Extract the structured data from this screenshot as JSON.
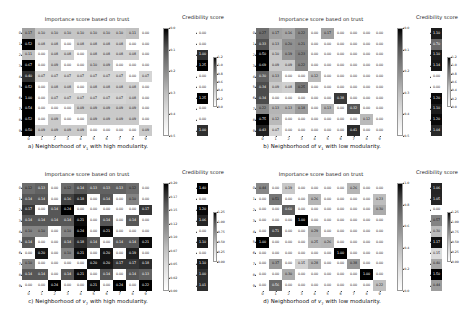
{
  "figure": {
    "width": 468,
    "height": 311,
    "background": "#ffffff",
    "colormap": "Greys"
  },
  "labels": {
    "importance_title": "Importance score based on trust",
    "credibility_title": "Credibility score",
    "xticks": [
      "0",
      "1",
      "2",
      "3",
      "4",
      "5",
      "6",
      "7",
      "8",
      "9"
    ],
    "yticks": [
      "0",
      "1",
      "2",
      "3",
      "4",
      "5",
      "6",
      "7",
      "8",
      "9"
    ],
    "cred_xtick": "0"
  },
  "panels": [
    {
      "id": "a",
      "caption_prefix": "a) Neighborhood of ",
      "caption_var": "v",
      "caption_sub": "1",
      "caption_suffix": " with high modularity.",
      "chart_data": {
        "type": "heatmap",
        "title": "Importance score based on trust",
        "xlabel": "",
        "ylabel": "",
        "xticklabels": [
          "0",
          "1",
          "2",
          "3",
          "4",
          "5",
          "6",
          "7",
          "8",
          "9"
        ],
        "yticklabels": [
          "0",
          "1",
          "2",
          "3",
          "4",
          "5",
          "6",
          "7",
          "8",
          "9"
        ],
        "cmap": "Greys",
        "vmin": 0.0,
        "vmax": 0.5,
        "colorbar_ticks": [
          "0.0",
          "0.1",
          "0.2",
          "0.3",
          "0.4",
          "0.5"
        ],
        "values": [
          [
            0.17,
            0.1,
            0.1,
            0.1,
            0.1,
            0.1,
            0.1,
            0.1,
            0.11,
            0.0
          ],
          [
            0.52,
            0.08,
            0.08,
            0.0,
            0.08,
            0.08,
            0.08,
            0.08,
            0.0,
            0.0
          ],
          [
            0.11,
            0.0,
            0.08,
            0.08,
            0.0,
            0.08,
            0.08,
            0.08,
            0.08,
            0.0
          ],
          [
            0.67,
            0.0,
            0.09,
            0.0,
            0.0,
            0.1,
            0.09,
            0.0,
            0.0,
            0.0
          ],
          [
            0.4,
            0.07,
            0.07,
            0.07,
            0.07,
            0.07,
            0.07,
            0.07,
            0.0,
            0.07
          ],
          [
            0.52,
            0.0,
            0.08,
            0.08,
            0.0,
            0.08,
            0.08,
            0.08,
            0.08,
            0.0
          ],
          [
            1.0,
            0.0,
            0.07,
            0.07,
            0.07,
            0.07,
            0.07,
            0.07,
            0.08,
            0.0
          ],
          [
            0.54,
            0.0,
            0.0,
            0.0,
            0.09,
            0.09,
            0.09,
            0.09,
            0.09,
            0.0
          ],
          [
            0.52,
            0.0,
            0.09,
            0.0,
            0.0,
            0.09,
            0.09,
            0.09,
            0.09,
            0.0
          ],
          [
            0.5,
            0.09,
            0.09,
            0.09,
            0.09,
            0.0,
            0.0,
            0.0,
            0.0,
            0.09
          ]
        ]
      },
      "credibility": {
        "type": "heatmap",
        "title": "Credibility score",
        "cmap": "Greys",
        "vmin": 0.0,
        "vmax": 1.25,
        "colorbar_ticks": [
          "1.2",
          "1.0",
          "0.8",
          "0.6",
          "0.4",
          "0.2",
          "0.0"
        ],
        "values": [
          [
            0.0
          ],
          [
            0.0
          ],
          [
            1.0
          ],
          [
            1.25
          ],
          [
            0.0
          ],
          [
            0.0
          ],
          [
            1.25
          ],
          [
            0.0
          ],
          [
            0.0
          ],
          [
            1.0
          ]
        ]
      }
    },
    {
      "id": "b",
      "caption_prefix": "b) Neighborhood of ",
      "caption_var": "v",
      "caption_sub": "1",
      "caption_suffix": " with low modularity.",
      "chart_data": {
        "type": "heatmap",
        "title": "Importance score based on trust",
        "xlabel": "",
        "ylabel": "",
        "xticklabels": [
          "0",
          "1",
          "2",
          "3",
          "4",
          "5",
          "6",
          "7",
          "8",
          "9"
        ],
        "yticklabels": [
          "0",
          "1",
          "2",
          "3",
          "4",
          "5",
          "6",
          "7",
          "8",
          "9"
        ],
        "cmap": "Greys",
        "vmin": 0.0,
        "vmax": 0.5,
        "colorbar_ticks": [
          "0.0",
          "0.1",
          "0.2",
          "0.3",
          "0.4",
          "0.5"
        ],
        "values": [
          [
            0.27,
            0.17,
            0.16,
            0.22,
            0.0,
            0.17,
            0.0,
            0.0,
            0.0,
            0.0
          ],
          [
            0.33,
            0.13,
            0.2,
            0.21,
            0.0,
            0.0,
            0.0,
            0.0,
            0.0,
            0.0
          ],
          [
            0.5,
            0.1,
            0.19,
            0.23,
            0.0,
            0.0,
            0.0,
            0.0,
            0.0,
            0.0
          ],
          [
            0.69,
            0.09,
            0.09,
            0.22,
            0.0,
            0.0,
            0.0,
            0.0,
            0.0,
            0.0
          ],
          [
            0.3,
            0.13,
            0.0,
            0.0,
            0.12,
            0.0,
            0.0,
            0.0,
            0.0,
            0.0
          ],
          [
            0.34,
            0.09,
            0.08,
            0.25,
            0.0,
            0.0,
            0.0,
            0.0,
            0.0,
            0.0
          ],
          [
            0.34,
            0.0,
            0.0,
            0.0,
            0.0,
            0.0,
            0.38,
            0.0,
            0.0,
            0.0
          ],
          [
            0.22,
            0.13,
            0.13,
            0.18,
            0.0,
            0.13,
            0.0,
            0.32,
            0.0,
            0.0
          ],
          [
            0.75,
            0.12,
            0.0,
            0.0,
            0.0,
            0.0,
            0.0,
            0.0,
            0.12,
            0.0
          ],
          [
            0.43,
            0.07,
            0.0,
            0.0,
            0.0,
            0.0,
            0.0,
            0.41,
            0.0,
            0.0
          ]
        ]
      },
      "credibility": {
        "type": "heatmap",
        "title": "Credibility score",
        "cmap": "Greys",
        "vmin": 0.0,
        "vmax": 1.25,
        "colorbar_ticks": [
          "1.2",
          "1.0",
          "0.8",
          "0.6",
          "0.4",
          "0.2",
          "0.0"
        ],
        "values": [
          [
            1.1
          ],
          [
            0.7
          ],
          [
            1.1
          ],
          [
            1.14
          ],
          [
            0.0
          ],
          [
            0.0
          ],
          [
            1.2
          ],
          [
            1.1
          ],
          [
            1.2
          ],
          [
            1.04
          ]
        ]
      }
    },
    {
      "id": "c",
      "caption_prefix": "c) Neighborhood of ",
      "caption_var": "v",
      "caption_sub": "7",
      "caption_suffix": " with high modularity.",
      "chart_data": {
        "type": "heatmap",
        "title": "Importance score based on trust",
        "xlabel": "",
        "ylabel": "",
        "xticklabels": [
          "0",
          "1",
          "2",
          "3",
          "4",
          "5",
          "6",
          "7",
          "8",
          "9"
        ],
        "yticklabels": [
          "0",
          "1",
          "2",
          "3",
          "4",
          "5",
          "6",
          "7",
          "8",
          "9"
        ],
        "cmap": "Greys",
        "vmin": 0.0,
        "vmax": 0.22,
        "colorbar_ticks": [
          "0.20",
          "0.17",
          "0.15",
          "0.12",
          "0.10",
          "0.07",
          "0.05",
          "0.02",
          "0.00"
        ],
        "values": [
          [
            0.12,
            0.13,
            0.0,
            0.12,
            0.14,
            0.13,
            0.13,
            0.13,
            0.12,
            0.0
          ],
          [
            0.14,
            0.14,
            0.0,
            0.16,
            0.18,
            0.0,
            0.14,
            0.0,
            0.1,
            0.0
          ],
          [
            0.17,
            0.0,
            0.14,
            0.24,
            0.0,
            0.0,
            0.0,
            0.0,
            0.0,
            0.17
          ],
          [
            0.14,
            0.14,
            0.14,
            0.14,
            0.21,
            0.0,
            0.14,
            0.0,
            0.14,
            0.0
          ],
          [
            0.1,
            0.1,
            0.0,
            0.1,
            0.24,
            0.0,
            0.21,
            0.0,
            0.0,
            0.0
          ],
          [
            0.14,
            0.0,
            0.0,
            0.14,
            0.18,
            0.14,
            0.0,
            0.14,
            0.14,
            0.21
          ],
          [
            0.0,
            0.2,
            0.0,
            0.1,
            0.21,
            0.0,
            0.2,
            0.0,
            0.19,
            0.0
          ],
          [
            0.1,
            0.0,
            0.0,
            0.0,
            0.0,
            0.2,
            0.2,
            0.17,
            0.17,
            0.18
          ],
          [
            0.14,
            0.14,
            0.0,
            0.14,
            0.21,
            0.0,
            0.14,
            0.0,
            0.14,
            0.13
          ],
          [
            0.0,
            0.0,
            0.24,
            0.0,
            0.0,
            0.21,
            0.0,
            0.24,
            0.0,
            0.22
          ]
        ]
      },
      "credibility": {
        "type": "heatmap",
        "title": "Credibility score",
        "cmap": "Greys",
        "vmin": 0.0,
        "vmax": 1.25,
        "colorbar_ticks": [
          "1.25",
          "1.00",
          "0.75",
          "0.50",
          "0.25",
          "0.00"
        ],
        "values": [
          [
            1.4
          ],
          [
            0.0
          ],
          [
            1.2
          ],
          [
            1.06
          ],
          [
            0.0
          ],
          [
            1.1
          ],
          [
            0.0
          ],
          [
            1.1
          ],
          [
            1.0
          ],
          [
            1.01
          ]
        ]
      }
    },
    {
      "id": "d",
      "caption_prefix": "d) Neighborhood of ",
      "caption_var": "v",
      "caption_sub": "7",
      "caption_suffix": " with low modularity.",
      "chart_data": {
        "type": "heatmap",
        "title": "Importance score based on trust",
        "xlabel": "",
        "ylabel": "",
        "xticklabels": [
          "0",
          "1",
          "2",
          "3",
          "4",
          "5",
          "6",
          "7",
          "8",
          "9"
        ],
        "yticklabels": [
          "0",
          "1",
          "2",
          "3",
          "4",
          "5",
          "6",
          "7",
          "8",
          "9"
        ],
        "cmap": "Greys",
        "vmin": 0.0,
        "vmax": 1.0,
        "colorbar_ticks": [
          "1.0",
          "0.8",
          "0.6",
          "0.4",
          "0.2",
          "0.0"
        ],
        "values": [
          [
            0.44,
            0.0,
            0.19,
            0.0,
            0.0,
            0.0,
            0.0,
            0.26,
            0.0,
            0.0
          ],
          [
            0.0,
            0.51,
            0.0,
            0.0,
            0.26,
            0.0,
            0.0,
            0.0,
            0.0,
            0.23
          ],
          [
            0.0,
            0.0,
            0.6,
            0.0,
            0.0,
            0.0,
            0.0,
            0.0,
            0.0,
            0.3
          ],
          [
            0.0,
            0.0,
            0.0,
            1.0,
            0.0,
            0.0,
            0.0,
            0.0,
            0.0,
            0.0
          ],
          [
            0.0,
            0.71,
            0.0,
            0.0,
            0.29,
            0.0,
            0.0,
            0.0,
            0.0,
            0.0
          ],
          [
            1.0,
            0.0,
            0.0,
            0.0,
            0.25,
            0.26,
            0.0,
            0.0,
            0.0,
            0.0
          ],
          [
            0.0,
            0.0,
            0.0,
            0.0,
            0.0,
            0.0,
            1.0,
            0.0,
            0.0,
            0.0
          ],
          [
            0.0,
            0.37,
            0.0,
            0.15,
            0.28,
            0.0,
            0.0,
            0.38,
            0.0,
            0.0
          ],
          [
            0.0,
            0.0,
            0.3,
            0.0,
            0.0,
            0.0,
            0.0,
            0.0,
            1.0,
            0.0
          ],
          [
            0.0,
            0.56,
            0.0,
            0.0,
            0.0,
            0.0,
            0.0,
            0.0,
            0.0,
            0.22
          ]
        ]
      },
      "credibility": {
        "type": "heatmap",
        "title": "Credibility score",
        "cmap": "Greys",
        "vmin": 0.0,
        "vmax": 1.25,
        "colorbar_ticks": [
          "1.25",
          "1.00",
          "0.75",
          "0.50",
          "0.25",
          "0.00"
        ],
        "values": [
          [
            1.06
          ],
          [
            1.05
          ],
          [
            0.0
          ],
          [
            0.57
          ],
          [
            0.3
          ],
          [
            1.17
          ],
          [
            0.15
          ],
          [
            0.4
          ],
          [
            1.5
          ],
          [
            0.44
          ]
        ]
      }
    }
  ]
}
